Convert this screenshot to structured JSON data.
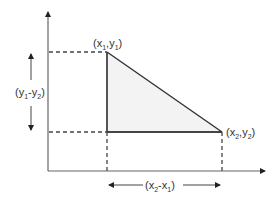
{
  "diagram": {
    "type": "slope-triangle",
    "colors": {
      "axis": "#555555",
      "triangle_stroke": "#333333",
      "triangle_fill": "#f2f2f2",
      "dashed": "#444444",
      "arrow": "#222222",
      "text": "#333333"
    },
    "labels": {
      "point1": {
        "open": "(x",
        "sub_a": "1",
        "mid": ",y",
        "sub_b": "1",
        "close": ")"
      },
      "point2": {
        "open": "(x",
        "sub_a": "2",
        "mid": ",y",
        "sub_b": "2",
        "close": ")"
      },
      "rise": {
        "open": "(y",
        "sub_a": "1",
        "mid": "-y",
        "sub_b": "2",
        "close": ")"
      },
      "run": {
        "open": "(x",
        "sub_a": "2",
        "mid": "-x",
        "sub_b": "1",
        "close": ")"
      }
    }
  }
}
